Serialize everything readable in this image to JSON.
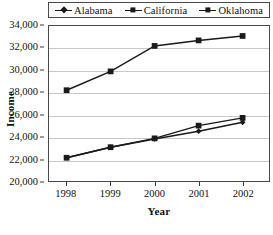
{
  "chart_data": {
    "type": "line",
    "title": "",
    "xlabel": "Year",
    "ylabel": "Income",
    "categories": [
      "1998",
      "1999",
      "2000",
      "2001",
      "2002"
    ],
    "x": [
      1998,
      1999,
      2000,
      2001,
      2002
    ],
    "xlim": [
      1997.6,
      2002.6
    ],
    "ylim": [
      20000,
      34000
    ],
    "ytick_labels": [
      "34,000",
      "32,000",
      "30,000",
      "28,000",
      "26,000",
      "24,000",
      "22,000",
      "20,000"
    ],
    "ytick_values": [
      34000,
      32000,
      30000,
      28000,
      26000,
      24000,
      22000,
      20000
    ],
    "grid": true,
    "legend_position": "top",
    "series": [
      {
        "name": "Alabama",
        "marker": "diamond",
        "color": "#1a1a1a",
        "values": [
          22100,
          23050,
          23800,
          24500,
          25300
        ]
      },
      {
        "name": "California",
        "marker": "square",
        "color": "#1a1a1a",
        "values": [
          22100,
          23050,
          23850,
          25000,
          25700
        ]
      },
      {
        "name": "Oklahoma",
        "marker": "square",
        "color": "#1a1a1a",
        "values": [
          28200,
          29900,
          32200,
          32700,
          33100
        ]
      }
    ]
  },
  "legend": {
    "items": [
      {
        "label": "Alabama",
        "marker": "diamond-marker-icon"
      },
      {
        "label": "California",
        "marker": "square-marker-icon"
      },
      {
        "label": "Oklahoma",
        "marker": "square-marker-icon"
      }
    ]
  },
  "axes": {
    "y_title": "Income",
    "x_title": "Year"
  },
  "colors": {
    "series_line": "#1a1a1a",
    "gridline": "#c9c9c9",
    "frame": "#4a4a4a",
    "background": "#ffffff"
  }
}
